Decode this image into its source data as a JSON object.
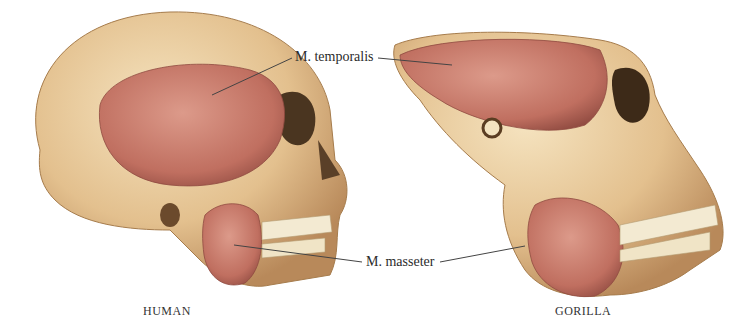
{
  "figure": {
    "labels": {
      "temporalis": "M. temporalis",
      "masseter": "M. masseter"
    },
    "captions": {
      "left": "HUMAN",
      "right": "GORILLA"
    },
    "colors": {
      "bone": "#e6c79a",
      "bone_shadow": "#b58a55",
      "muscle": "#c9786a",
      "muscle_dark": "#9e4f45",
      "teeth": "#f3ead2"
    }
  }
}
